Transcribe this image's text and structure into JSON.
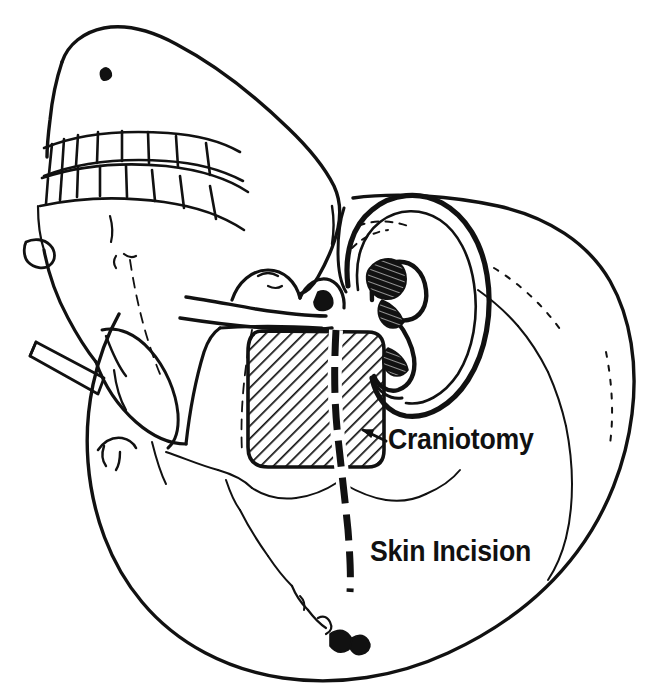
{
  "figure": {
    "type": "anatomical-line-drawing",
    "background_color": "#ffffff",
    "ink_color": "#111111",
    "canvas": {
      "width": 664,
      "height": 699
    }
  },
  "labels": {
    "craniotomy": "Craniotomy",
    "skin_incision": "Skin Incision"
  },
  "annotations": {
    "craniotomy_arrow": {
      "name": "arrow-to-craniotomy",
      "points_to": "craniotomy-hatched-region",
      "tip_x": 362,
      "tip_y": 432,
      "tail_x": 384,
      "tail_y": 440
    }
  },
  "regions": {
    "craniotomy": {
      "name": "craniotomy-hatched-region",
      "shape": "rounded-rectangle",
      "fill": "diagonal-hatch",
      "hatch_angle_deg": 45,
      "hatch_color": "#111111",
      "x": 248,
      "y": 331,
      "width": 136,
      "height": 137
    },
    "skin_incision": {
      "name": "skin-incision-line",
      "style": "dashed",
      "stroke_width": 7,
      "color": "#111111",
      "top_x": 336,
      "top_y": 330,
      "bottom_x": 350,
      "bottom_y": 592
    }
  },
  "anatomy": {
    "parts": [
      {
        "key": "cranial-vault",
        "label": "Cranial vault"
      },
      {
        "key": "maxilla",
        "label": "Maxilla"
      },
      {
        "key": "mandible",
        "label": "Mandible"
      },
      {
        "key": "upper-teeth-row",
        "label": "Upper teeth",
        "count": 8
      },
      {
        "key": "lower-teeth-row",
        "label": "Lower teeth",
        "count": 8
      },
      {
        "key": "zygomatic-arch",
        "label": "Zygomatic arch"
      },
      {
        "key": "external-ear",
        "label": "External ear (pinna)"
      },
      {
        "key": "concha",
        "label": "Concha"
      },
      {
        "key": "mastoid-process",
        "label": "Mastoid process"
      },
      {
        "key": "squamous-suture",
        "label": "Squamous suture"
      },
      {
        "key": "lambdoid-suture",
        "label": "Lambdoid suture"
      },
      {
        "key": "occiput",
        "label": "Occiput"
      }
    ]
  }
}
